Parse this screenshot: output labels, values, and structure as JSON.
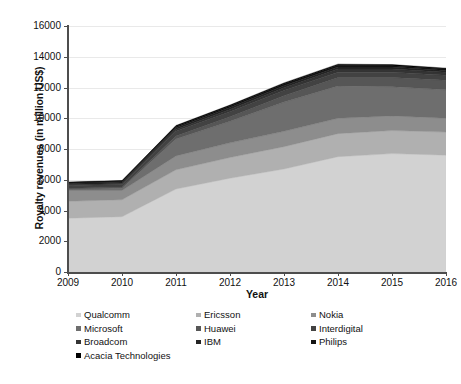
{
  "chart_data": {
    "type": "area",
    "stacked": true,
    "title": "",
    "subtitle": "",
    "xlabel": "Year",
    "ylabel": "Royalty revenues (in million US$)",
    "categories": [
      "2009",
      "2010",
      "2011",
      "2012",
      "2013",
      "2014",
      "2015",
      "2016"
    ],
    "x": [
      2009,
      2010,
      2011,
      2012,
      2013,
      2014,
      2015,
      2016
    ],
    "ylim": [
      0,
      16000
    ],
    "ytick_values": [
      0,
      2000,
      4000,
      6000,
      8000,
      10000,
      12000,
      14000,
      16000
    ],
    "ytick_labels": [
      "0",
      "2000",
      "4000",
      "6000",
      "8000",
      "10000",
      "12000",
      "14000",
      "16000"
    ],
    "xtick_labels": [
      "2009",
      "2010",
      "2011",
      "2012",
      "2013",
      "2014",
      "2015",
      "2016"
    ],
    "grid": true,
    "legend_position": "below",
    "legend_columns": 3,
    "series": [
      {
        "name": "Qualcomm",
        "color": "#d2d2d2",
        "values": [
          3500,
          3600,
          5400,
          6100,
          6700,
          7500,
          7700,
          7600
        ]
      },
      {
        "name": "Ericsson",
        "color": "#b0b0b0",
        "values": [
          1100,
          1100,
          1250,
          1350,
          1450,
          1500,
          1500,
          1500
        ]
      },
      {
        "name": "Nokia",
        "color": "#8d8d8d",
        "values": [
          700,
          600,
          900,
          950,
          1000,
          1000,
          950,
          900
        ]
      },
      {
        "name": "Microsoft",
        "color": "#6e6e6e",
        "values": [
          100,
          150,
          1100,
          1400,
          1900,
          2100,
          1900,
          1850
        ]
      },
      {
        "name": "Huawei",
        "color": "#565656",
        "values": [
          50,
          60,
          200,
          300,
          420,
          550,
          600,
          620
        ]
      },
      {
        "name": "Interdigital",
        "color": "#424242",
        "values": [
          170,
          180,
          300,
          320,
          330,
          350,
          350,
          330
        ]
      },
      {
        "name": "Broadcom",
        "color": "#343434",
        "values": [
          60,
          70,
          120,
          150,
          180,
          200,
          200,
          190
        ]
      },
      {
        "name": "IBM",
        "color": "#242424",
        "values": [
          80,
          90,
          120,
          130,
          140,
          140,
          130,
          120
        ]
      },
      {
        "name": "Philips",
        "color": "#141414",
        "values": [
          50,
          60,
          80,
          90,
          100,
          100,
          90,
          90
        ]
      },
      {
        "name": "Acacia Technologies",
        "color": "#000000",
        "values": [
          40,
          40,
          60,
          70,
          80,
          80,
          70,
          60
        ]
      }
    ],
    "totals": [
      5850,
      5950,
      9530,
      10860,
      12300,
      13520,
      13490,
      13260
    ]
  },
  "legend": {
    "rows": [
      [
        {
          "label": "Qualcomm",
          "color": "#d2d2d2"
        },
        {
          "label": "Ericsson",
          "color": "#b0b0b0"
        },
        {
          "label": "Nokia",
          "color": "#8d8d8d"
        }
      ],
      [
        {
          "label": "Microsoft",
          "color": "#6e6e6e"
        },
        {
          "label": "Huawei",
          "color": "#565656"
        },
        {
          "label": "Interdigital",
          "color": "#424242"
        }
      ],
      [
        {
          "label": "Broadcom",
          "color": "#343434"
        },
        {
          "label": "IBM",
          "color": "#242424"
        },
        {
          "label": "Philips",
          "color": "#141414"
        }
      ],
      [
        {
          "label": "Acacia Technologies",
          "color": "#000000"
        }
      ]
    ]
  },
  "caption": {
    "text": ""
  },
  "colors": {
    "axis": "#4d4d4d",
    "grid": "#e9e9e9",
    "background": "#ffffff",
    "text": "#111111"
  }
}
